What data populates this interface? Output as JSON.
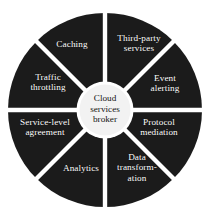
{
  "diagram": {
    "type": "segmented-wheel",
    "title": "Cloud services broker",
    "hub": {
      "label": "Cloud\nservices\nbroker",
      "fill_color": "#f2f2f2",
      "text_color": "#141414"
    },
    "ring": {
      "fill_color": "#1b1b1b",
      "divider_color": "#ffffff",
      "text_color": "#ffffff",
      "segment_count": 8
    },
    "background_color": "#ffffff",
    "segments": [
      {
        "id": "third-party-services",
        "label": "Third-party\nservices",
        "start_angle": -90,
        "end_angle": -45
      },
      {
        "id": "event-alerting",
        "label": "Event\nalerting",
        "start_angle": -45,
        "end_angle": 0
      },
      {
        "id": "protocol-mediation",
        "label": "Protocol\nmediation",
        "start_angle": 0,
        "end_angle": 45
      },
      {
        "id": "data-transformation",
        "label": "Data\ntransform-\nation",
        "start_angle": 45,
        "end_angle": 90
      },
      {
        "id": "analytics",
        "label": "Analytics",
        "start_angle": 90,
        "end_angle": 135
      },
      {
        "id": "service-level-agreement",
        "label": "Service-level\nagreement",
        "start_angle": 135,
        "end_angle": 180
      },
      {
        "id": "traffic-throttling",
        "label": "Traffic\nthrottling",
        "start_angle": 180,
        "end_angle": 225
      },
      {
        "id": "caching",
        "label": "Caching",
        "start_angle": 225,
        "end_angle": 270
      }
    ]
  }
}
